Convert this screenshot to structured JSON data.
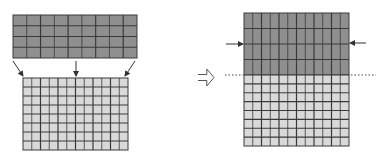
{
  "diagram": {
    "colors": {
      "coarse_fill": "#8f8f8f",
      "fine_fill": "#d9d9d9",
      "grid_line": "#3a3a3a",
      "arrow": "#333333",
      "background": "#ffffff"
    },
    "left_panel": {
      "coarse_grid": {
        "x": 13,
        "y": 15,
        "width": 124,
        "height": 43,
        "cols": 9,
        "rows": 4
      },
      "fine_grid": {
        "x": 23,
        "y": 78,
        "width": 105,
        "height": 72,
        "cols": 12,
        "rows": 8
      },
      "mapping_arrows": [
        {
          "x1": 13,
          "y1": 61,
          "x2": 23,
          "y2": 76
        },
        {
          "x1": 76,
          "y1": 61,
          "x2": 76,
          "y2": 76
        },
        {
          "x1": 135,
          "y1": 61,
          "x2": 125,
          "y2": 76
        }
      ]
    },
    "transition_arrow": {
      "x": 198,
      "y": 69,
      "width": 16,
      "height": 17,
      "style": "hollow"
    },
    "right_panel": {
      "coarse_region": {
        "x": 244,
        "y": 13,
        "width": 105,
        "height": 62,
        "cols": 12,
        "rows": 4
      },
      "fine_region": {
        "x": 244,
        "y": 75,
        "width": 105,
        "height": 71,
        "cols": 12,
        "rows": 8
      },
      "side_arrows": [
        {
          "side": "left",
          "x1": 226,
          "y1": 44,
          "x2": 243,
          "y2": 44
        },
        {
          "side": "right",
          "x1": 366,
          "y1": 43,
          "x2": 350,
          "y2": 43
        }
      ],
      "interface_lines": [
        {
          "side": "left",
          "x1": 225,
          "x2": 243,
          "y": 75
        },
        {
          "side": "right",
          "x1": 351,
          "x2": 376,
          "y": 75
        }
      ]
    }
  }
}
